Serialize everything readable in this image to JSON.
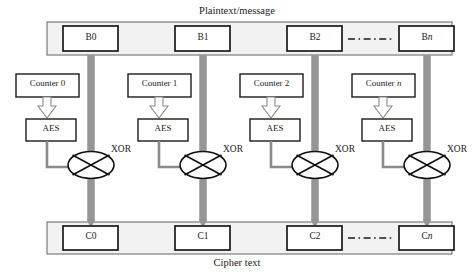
{
  "diagram": {
    "top_caption": "Plaintext/message",
    "bottom_caption": "Cipher text",
    "xor_label": "XOR",
    "aes_label": "AES",
    "ellipsis": "— - — - — -",
    "colors": {
      "data_arrow": "#969696",
      "bar_fill": "#f2f2f2",
      "bar_stroke": "#6f6f6f",
      "box_stroke": "#1a1a1a",
      "box_fill": "#ffffff",
      "key_arrow_fill": "#ffffff",
      "key_arrow_stroke": "#8a8a8a",
      "text": "#1b1b1b"
    },
    "plaintext_blocks": [
      {
        "id": "b0",
        "label": "B0",
        "italic_suffix": ""
      },
      {
        "id": "b1",
        "label": "B1",
        "italic_suffix": ""
      },
      {
        "id": "b2",
        "label": "B2",
        "italic_suffix": ""
      },
      {
        "id": "bn",
        "label": "B",
        "italic_suffix": "n"
      }
    ],
    "counters": [
      {
        "id": "counter0",
        "label": "Counter 0",
        "italic_suffix": ""
      },
      {
        "id": "counter1",
        "label": "Counter 1",
        "italic_suffix": ""
      },
      {
        "id": "counter2",
        "label": "Counter 2",
        "italic_suffix": ""
      },
      {
        "id": "countern",
        "label": "Counter ",
        "italic_suffix": "n"
      }
    ],
    "aes_blocks": [
      {
        "id": "aes0",
        "label": "AES"
      },
      {
        "id": "aes1",
        "label": "AES"
      },
      {
        "id": "aes2",
        "label": "AES"
      },
      {
        "id": "aesn",
        "label": "AES"
      }
    ],
    "xor_nodes": [
      {
        "id": "xor0",
        "label": "XOR"
      },
      {
        "id": "xor1",
        "label": "XOR"
      },
      {
        "id": "xor2",
        "label": "XOR"
      },
      {
        "id": "xorn",
        "label": "XOR"
      }
    ],
    "cipher_blocks": [
      {
        "id": "c0",
        "label": "C0",
        "italic_suffix": ""
      },
      {
        "id": "c1",
        "label": "C1",
        "italic_suffix": ""
      },
      {
        "id": "c2",
        "label": "C2",
        "italic_suffix": ""
      },
      {
        "id": "cn",
        "label": "C",
        "italic_suffix": "n"
      }
    ]
  }
}
